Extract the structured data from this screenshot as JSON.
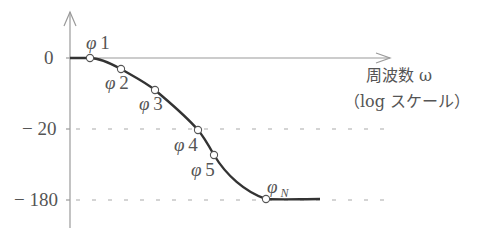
{
  "diagram": {
    "type": "phase-frequency-plot",
    "x_axis": {
      "label_line1": "周波数 ω",
      "label_line2": "（log スケール）"
    },
    "y_axis": {
      "ticks": [
        {
          "label": "0",
          "y": 58
        },
        {
          "label": "− 20",
          "y": 129
        },
        {
          "label": "− 180",
          "y": 200
        }
      ]
    },
    "points": [
      {
        "name": "φ",
        "index": "1",
        "x": 90,
        "y": 58
      },
      {
        "name": "φ",
        "index": "2",
        "x": 121,
        "y": 69
      },
      {
        "name": "φ",
        "index": "3",
        "x": 155,
        "y": 90
      },
      {
        "name": "φ",
        "index": "4",
        "x": 198,
        "y": 130
      },
      {
        "name": "φ",
        "index": "5",
        "x": 214,
        "y": 155
      },
      {
        "name": "φ",
        "index": "N",
        "x": 266,
        "y": 199
      }
    ],
    "colors": {
      "axis": "#999999",
      "curve": "#333333",
      "dashed": "#aaaaaa",
      "text": "#555555"
    }
  }
}
